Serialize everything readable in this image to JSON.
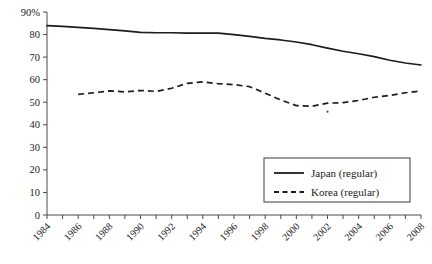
{
  "chart_data": {
    "type": "line",
    "title": "",
    "xlabel": "",
    "ylabel": "",
    "xlim": [
      1984,
      2008
    ],
    "ylim": [
      0,
      90
    ],
    "grid": false,
    "legend_position": "bottom-right",
    "y_ticks": [
      0,
      10,
      20,
      30,
      40,
      50,
      60,
      70,
      80,
      90
    ],
    "y_tick_labels": [
      "0",
      "10",
      "20",
      "30",
      "40",
      "50",
      "60",
      "70",
      "80",
      "90%"
    ],
    "x_ticks": [
      1984,
      1985,
      1986,
      1987,
      1988,
      1989,
      1990,
      1991,
      1992,
      1993,
      1994,
      1995,
      1996,
      1997,
      1998,
      1999,
      2000,
      2001,
      2002,
      2003,
      2004,
      2005,
      2006,
      2007,
      2008
    ],
    "x_tick_labels": [
      "1984",
      "1986",
      "1988",
      "1990",
      "1992",
      "1994",
      "1996",
      "1998",
      "2000",
      "2002",
      "2004",
      "2006",
      "2008"
    ],
    "x_tick_label_years": [
      1984,
      1986,
      1988,
      1990,
      1992,
      1994,
      1996,
      1998,
      2000,
      2002,
      2004,
      2006,
      2008
    ],
    "x_tick_label_rotation": 45,
    "series": [
      {
        "name": "Japan (regular)",
        "style": "solid",
        "color": "#1d1d1d",
        "x": [
          1984,
          1985,
          1986,
          1987,
          1988,
          1989,
          1990,
          1991,
          1992,
          1993,
          1994,
          1995,
          1996,
          1997,
          1998,
          1999,
          2000,
          2001,
          2002,
          2003,
          2004,
          2005,
          2006,
          2007,
          2008
        ],
        "values": [
          84.0,
          83.6,
          83.2,
          82.7,
          82.2,
          81.6,
          81.0,
          80.8,
          80.8,
          80.6,
          80.7,
          80.6,
          80.0,
          79.2,
          78.3,
          77.6,
          76.7,
          75.5,
          74.0,
          72.6,
          71.5,
          70.2,
          68.6,
          67.4,
          66.5
        ]
      },
      {
        "name": "Korea (regular)",
        "style": "dashed",
        "color": "#1d1d1d",
        "x": [
          1986,
          1987,
          1988,
          1989,
          1990,
          1991,
          1992,
          1993,
          1994,
          1995,
          1996,
          1997,
          1998,
          1999,
          2000,
          2001,
          2002,
          2003,
          2004,
          2005,
          2006,
          2007,
          2008
        ],
        "values": [
          53.5,
          54.2,
          55.0,
          54.6,
          55.2,
          54.8,
          56.2,
          58.4,
          59.0,
          58.2,
          57.8,
          56.9,
          54.0,
          51.0,
          48.5,
          48.2,
          49.6,
          49.8,
          50.8,
          52.2,
          53.0,
          54.2,
          55.0
        ]
      }
    ],
    "annotations": [
      {
        "name": "stray-marker",
        "x": 2002,
        "y": 45.8
      }
    ]
  },
  "legend": {
    "entries": [
      {
        "label": "Japan (regular)",
        "style": "solid"
      },
      {
        "label": "Korea (regular)",
        "style": "dashed"
      }
    ]
  }
}
